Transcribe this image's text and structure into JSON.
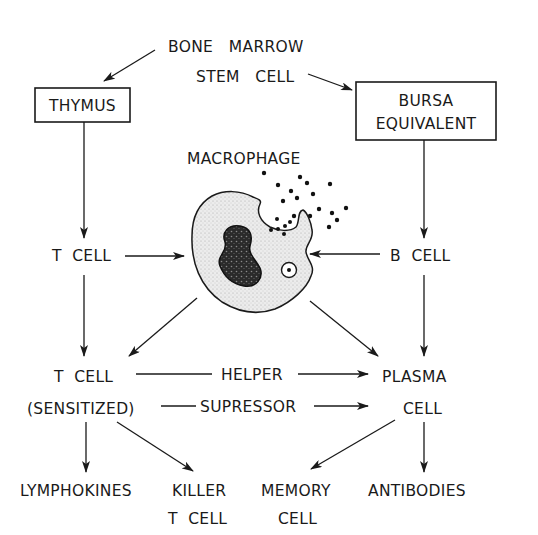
{
  "diagram": {
    "type": "immune-cell-lineage-flowchart",
    "nodes": {
      "source": {
        "line1": "BONE   MARROW",
        "line2": "STEM   CELL"
      },
      "thymus": {
        "label": "THYMUS"
      },
      "bursa": {
        "line1": "BURSA",
        "line2": "EQUIVALENT"
      },
      "macrophage": {
        "label": "MACROPHAGE"
      },
      "t_cell": {
        "label": "T  CELL"
      },
      "b_cell": {
        "label": "B  CELL"
      },
      "t_cell_sensitized": {
        "line1": "T  CELL",
        "line2": "(SENSITIZED)"
      },
      "plasma_cell": {
        "line1": "PLASMA",
        "line2": "CELL"
      },
      "lymphokines": {
        "label": "LYMPHOKINES"
      },
      "killer_t_cell": {
        "line1": "KILLER",
        "line2": "T  CELL"
      },
      "memory_cell": {
        "line1": "MEMORY",
        "line2": "CELL"
      },
      "antibodies": {
        "label": "ANTIBODIES"
      }
    },
    "edge_labels": {
      "helper": "HELPER",
      "supressor": "SUPRESSOR"
    },
    "edges": [
      {
        "from": "source",
        "to": "thymus"
      },
      {
        "from": "source",
        "to": "bursa"
      },
      {
        "from": "thymus",
        "to": "t_cell"
      },
      {
        "from": "bursa",
        "to": "b_cell"
      },
      {
        "from": "t_cell",
        "to": "macrophage"
      },
      {
        "from": "b_cell",
        "to": "macrophage"
      },
      {
        "from": "t_cell",
        "to": "t_cell_sensitized"
      },
      {
        "from": "b_cell",
        "to": "plasma_cell"
      },
      {
        "from": "macrophage",
        "to": "t_cell_sensitized"
      },
      {
        "from": "macrophage",
        "to": "plasma_cell"
      },
      {
        "from": "t_cell_sensitized",
        "to": "plasma_cell",
        "label": "HELPER"
      },
      {
        "from": "t_cell_sensitized",
        "to": "plasma_cell",
        "label": "SUPRESSOR"
      },
      {
        "from": "t_cell_sensitized",
        "to": "lymphokines"
      },
      {
        "from": "t_cell_sensitized",
        "to": "killer_t_cell"
      },
      {
        "from": "plasma_cell",
        "to": "memory_cell"
      },
      {
        "from": "plasma_cell",
        "to": "antibodies"
      }
    ],
    "colors": {
      "ink": "#1a1a1a",
      "background": "#ffffff",
      "cytoplasm": "#e4e4e4",
      "nucleus": "#2a2a2a"
    }
  }
}
